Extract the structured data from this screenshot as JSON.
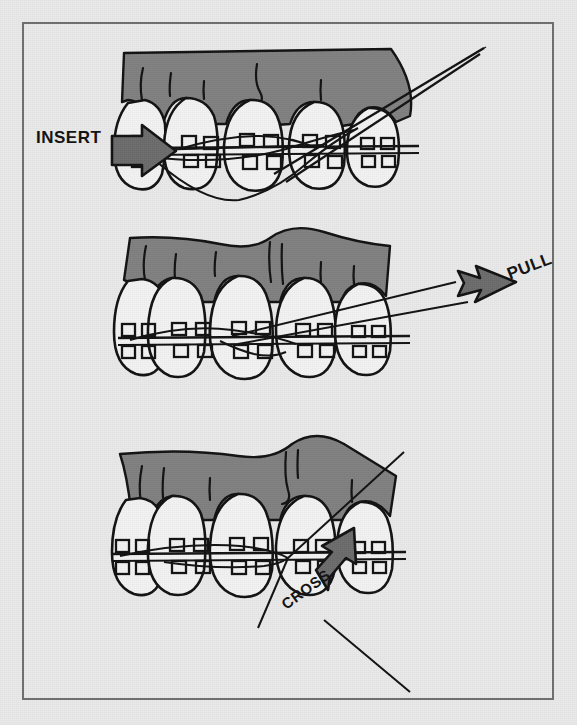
{
  "figure": {
    "background_color": "#e9e9e9",
    "frame_color": "#6e6e6e",
    "gum_color": "#808080",
    "tooth_color": "#f2f2f2",
    "arrow_fill_color": "#6b6b6b",
    "ink_color": "#111111"
  },
  "panels": [
    {
      "id": "insert",
      "step": 1,
      "label": "INSERT",
      "label_rotation_deg": 0,
      "arrow": {
        "name": "insert-arrow",
        "direction": "right",
        "rotation_deg": 0
      },
      "teeth_count": 5,
      "has_threader_needle": true,
      "description": "Floss threader needle inserted under the archwire between the teeth"
    },
    {
      "id": "pull",
      "step": 2,
      "label": "PULL",
      "label_rotation_deg": -21,
      "arrow": {
        "name": "pull-arrow",
        "direction": "right",
        "rotation_deg": 0
      },
      "teeth_count": 5,
      "has_threader_needle": true,
      "description": "Floss pulled through behind the archwire and out to the side"
    },
    {
      "id": "cross",
      "step": 3,
      "label": "CROSS",
      "label_rotation_deg": -36,
      "arrow": {
        "name": "cross-arrow",
        "direction": "up-left",
        "rotation_deg": -38
      },
      "teeth_count": 5,
      "has_threader_needle": true,
      "description": "Floss crossed between adjacent teeth and worked up to the gumline"
    }
  ]
}
